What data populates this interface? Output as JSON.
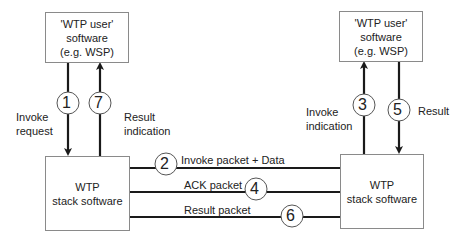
{
  "nodes": {
    "user_left": {
      "lines": [
        "'WTP user'",
        "software",
        "(e.g. WSP)"
      ]
    },
    "user_right": {
      "lines": [
        "'WTP user'",
        "software",
        "(e.g. WSP)"
      ]
    },
    "stack_left": {
      "lines": [
        "WTP",
        "stack software"
      ]
    },
    "stack_right": {
      "lines": [
        "WTP",
        "stack software"
      ]
    }
  },
  "steps": [
    {
      "num": "1",
      "label": [
        "Invoke",
        "request"
      ],
      "from": "user_left",
      "to": "stack_left"
    },
    {
      "num": "2",
      "label": [
        "Invoke packet + Data"
      ],
      "from": "stack_left",
      "to": "stack_right"
    },
    {
      "num": "3",
      "label": [
        "Invoke",
        "indication"
      ],
      "from": "stack_right",
      "to": "user_right"
    },
    {
      "num": "4",
      "label": [
        "ACK packet"
      ],
      "from": "stack_right",
      "to": "stack_left"
    },
    {
      "num": "5",
      "label": [
        "Result"
      ],
      "from": "user_right",
      "to": "stack_right"
    },
    {
      "num": "6",
      "label": [
        "Result packet"
      ],
      "from": "stack_right",
      "to": "stack_left"
    },
    {
      "num": "7",
      "label": [
        "Result",
        "indication"
      ],
      "from": "stack_left",
      "to": "user_left"
    }
  ],
  "colors": {
    "line": "#1a1a1a",
    "box_border": "#8a8a8a",
    "text": "#222222"
  }
}
